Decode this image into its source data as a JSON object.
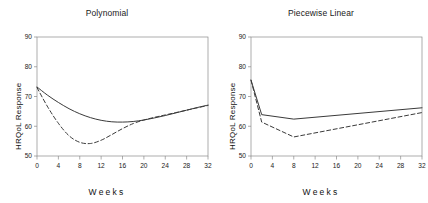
{
  "figure": {
    "background_color": "#ffffff",
    "line_color": "#3a3a3a",
    "axis_color": "#8a8a8a",
    "text_color": "#1a1a1a"
  },
  "panels": [
    {
      "id": "polynomial",
      "title": "Polynomial",
      "xlabel": "Weeks",
      "ylabel": "HRQoL Response"
    },
    {
      "id": "piecewise-linear",
      "title": "Piecewise Linear",
      "xlabel": "Weeks",
      "ylabel": "HRQoL Response"
    }
  ],
  "chart_data": [
    {
      "type": "line",
      "id": "polynomial",
      "title": "Polynomial",
      "xlabel": "Weeks",
      "ylabel": "HRQoL Response",
      "xlim": [
        0,
        32
      ],
      "ylim": [
        50,
        90
      ],
      "xticks": [
        0,
        4,
        8,
        12,
        16,
        20,
        24,
        28,
        32
      ],
      "yticks": [
        50,
        60,
        70,
        80,
        90
      ],
      "grid": false,
      "legend": "none",
      "series": [
        {
          "name": "solid",
          "style": "solid",
          "x": [
            0,
            2,
            4,
            6,
            8,
            10,
            12,
            14,
            16,
            18,
            20,
            22,
            24,
            26,
            28,
            30,
            32
          ],
          "y": [
            73.2,
            70.4,
            68.0,
            65.9,
            64.2,
            62.9,
            62.0,
            61.5,
            61.4,
            61.6,
            62.1,
            62.8,
            63.6,
            64.5,
            65.4,
            66.3,
            67.1
          ]
        },
        {
          "name": "dashed",
          "style": "dashed",
          "x": [
            0,
            2,
            4,
            6,
            8,
            10,
            12,
            14,
            16,
            18,
            20,
            22,
            24,
            26,
            28,
            30,
            32
          ],
          "y": [
            73.0,
            66.5,
            61.0,
            56.8,
            54.6,
            54.2,
            55.3,
            57.2,
            59.2,
            60.9,
            62.1,
            63.0,
            63.8,
            64.6,
            65.4,
            66.2,
            67.0
          ]
        }
      ]
    },
    {
      "type": "line",
      "id": "piecewise-linear",
      "title": "Piecewise Linear",
      "xlabel": "Weeks",
      "ylabel": "HRQoL Response",
      "xlim": [
        0,
        32
      ],
      "ylim": [
        50,
        90
      ],
      "xticks": [
        0,
        4,
        8,
        12,
        16,
        20,
        24,
        28,
        32
      ],
      "yticks": [
        50,
        60,
        70,
        80,
        90
      ],
      "grid": false,
      "legend": "none",
      "series": [
        {
          "name": "solid",
          "style": "solid",
          "knots": [
            0,
            2,
            8,
            32
          ],
          "x": [
            0,
            2,
            8,
            32
          ],
          "y": [
            75.5,
            63.9,
            62.4,
            66.2
          ]
        },
        {
          "name": "dashed",
          "style": "dashed",
          "knots": [
            0,
            2,
            8,
            32
          ],
          "x": [
            0,
            2,
            8,
            32
          ],
          "y": [
            75.5,
            61.4,
            56.4,
            64.6
          ]
        }
      ]
    }
  ]
}
